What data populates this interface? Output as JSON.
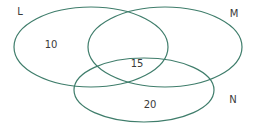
{
  "diagram": {
    "type": "venn",
    "stroke_color": "#3f7d6b",
    "text_color": "#3a3a3a",
    "sets": [
      {
        "label": "L",
        "cx": 91,
        "cy": 47,
        "rx": 77,
        "ry": 40,
        "label_x": 20,
        "label_y": 11
      },
      {
        "label": "M",
        "cx": 165,
        "cy": 47,
        "rx": 77,
        "ry": 40,
        "label_x": 234,
        "label_y": 13
      },
      {
        "label": "N",
        "cx": 144,
        "cy": 90,
        "rx": 70,
        "ry": 32,
        "label_x": 233,
        "label_y": 99
      }
    ],
    "regions": [
      {
        "name": "L only",
        "value": "10",
        "x": 51,
        "y": 44
      },
      {
        "name": "L and M and N",
        "value": "15",
        "x": 137,
        "y": 63
      },
      {
        "name": "N only",
        "value": "20",
        "x": 150,
        "y": 104
      }
    ]
  }
}
